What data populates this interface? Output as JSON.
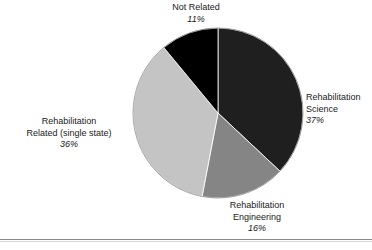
{
  "chart_data": {
    "type": "pie",
    "title": "",
    "subtitle": "",
    "xlabel": "",
    "ylabel": "",
    "legend_position": "none",
    "grid": false,
    "value_unit": "%",
    "start_angle_deg": 0,
    "direction": "clockwise",
    "categories": [
      "Rehabilitation Science",
      "Rehabilitation Engineering",
      "Rehabilitation Related (single state)",
      "Not Related"
    ],
    "values": [
      37,
      16,
      36,
      11
    ],
    "slices": [
      {
        "label_line1": "Rehabilitation",
        "label_line2": "Science",
        "value": 37,
        "value_text": "37%",
        "color": "#1f1f1f",
        "start_deg": 0,
        "end_deg": 133.2
      },
      {
        "label_line1": "Rehabilitation",
        "label_line2": "Engineering",
        "value": 16,
        "value_text": "16%",
        "color": "#858585",
        "start_deg": 133.2,
        "end_deg": 190.8
      },
      {
        "label_line1": "Rehabilitation",
        "label_line2": "Related (single state)",
        "value": 36,
        "value_text": "36%",
        "color": "#c4c4c4",
        "start_deg": 190.8,
        "end_deg": 320.4
      },
      {
        "label_line1": "Not Related",
        "label_line2": "",
        "value": 11,
        "value_text": "11%",
        "color": "#000000",
        "start_deg": 320.4,
        "end_deg": 360
      }
    ]
  },
  "labels": {
    "not_related": {
      "name": "Not Related",
      "pct": "11%"
    },
    "rehab_science": {
      "name_line1": "Rehabilitation",
      "name_line2": "Science",
      "pct": "37%"
    },
    "rehab_engineering": {
      "name_line1": "Rehabilitation",
      "name_line2": "Engineering",
      "pct": "16%"
    },
    "rehab_related": {
      "name_line1": "Rehabilitation",
      "name_line2": "Related (single state)",
      "pct": "36%"
    }
  },
  "colors": {
    "slice_dark": "#1f1f1f",
    "slice_medium": "#858585",
    "slice_light": "#c4c4c4",
    "slice_black": "#000000",
    "background": "#ffffff",
    "text": "#1a1a1a",
    "rule": "#8a8a8a"
  }
}
